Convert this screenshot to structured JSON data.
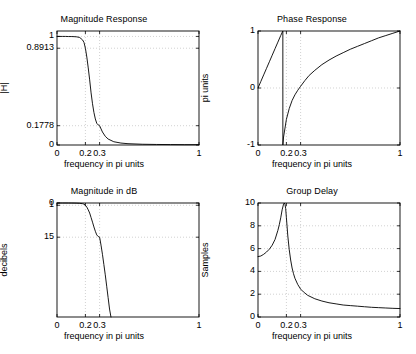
{
  "figure": {
    "background": "#ffffff",
    "line_color": "#000000",
    "grid_color": "#bfbfbf",
    "axis_color": "#000000",
    "width": 416,
    "height": 354
  },
  "chart_data": [
    {
      "type": "line",
      "title": "Magnitude Response",
      "xlabel": "frequency in pi units",
      "ylabel": "|H|",
      "xlim": [
        0,
        1
      ],
      "ylim": [
        0,
        1.05
      ],
      "grid": true,
      "xticks": [
        0,
        0.2,
        0.3,
        1
      ],
      "xticklabels": [
        "0",
        "0.2",
        "0.3",
        "1"
      ],
      "yticks": [
        0,
        0.1778,
        0.8913,
        1
      ],
      "yticklabels": [
        "0",
        "0.1778",
        "0.8913",
        "1"
      ],
      "series": [
        {
          "name": "|H(w)|",
          "x": [
            0,
            0.02,
            0.04,
            0.06,
            0.08,
            0.1,
            0.12,
            0.14,
            0.16,
            0.18,
            0.19,
            0.2,
            0.21,
            0.22,
            0.23,
            0.24,
            0.25,
            0.26,
            0.27,
            0.28,
            0.29,
            0.3,
            0.32,
            0.34,
            0.36,
            0.4,
            0.45,
            0.5,
            0.6,
            0.7,
            0.8,
            0.9,
            1
          ],
          "y": [
            1,
            1,
            1,
            1,
            0.999,
            0.999,
            0.998,
            0.996,
            0.99,
            0.968,
            0.945,
            0.8913,
            0.81,
            0.71,
            0.6,
            0.48,
            0.38,
            0.3,
            0.24,
            0.2,
            0.185,
            0.1778,
            0.12,
            0.08,
            0.055,
            0.03,
            0.018,
            0.012,
            0.007,
            0.005,
            0.004,
            0.003,
            0.003
          ]
        }
      ]
    },
    {
      "type": "line",
      "title": "Phase Response",
      "xlabel": "frequency in pi units",
      "ylabel": "pi units",
      "xlim": [
        0,
        1
      ],
      "ylim": [
        -1,
        1
      ],
      "grid": true,
      "xticks": [
        0,
        0.2,
        0.3,
        1
      ],
      "xticklabels": [
        "0",
        "0.2",
        "0.3",
        "1"
      ],
      "yticks": [
        -1,
        0,
        1
      ],
      "yticklabels": [
        "-1",
        "0",
        "1"
      ],
      "series": [
        {
          "name": "angle(H(w))/pi",
          "x": [
            0,
            0.02,
            0.04,
            0.06,
            0.08,
            0.1,
            0.12,
            0.14,
            0.16,
            0.172,
            0.175,
            0.1751,
            0.18,
            0.2,
            0.22,
            0.24,
            0.26,
            0.28,
            0.3,
            0.33,
            0.36,
            0.4,
            0.45,
            0.5,
            0.55,
            0.6,
            0.65,
            0.7,
            0.75,
            0.8,
            0.85,
            0.9,
            0.95,
            1
          ],
          "y": [
            0,
            0.115,
            0.23,
            0.345,
            0.46,
            0.575,
            0.69,
            0.805,
            0.92,
            0.985,
            1.0,
            -1.0,
            -0.86,
            -0.55,
            -0.36,
            -0.22,
            -0.12,
            -0.04,
            0.03,
            0.13,
            0.22,
            0.31,
            0.41,
            0.49,
            0.56,
            0.62,
            0.68,
            0.73,
            0.78,
            0.83,
            0.88,
            0.92,
            0.96,
            1.0
          ]
        }
      ]
    },
    {
      "type": "line",
      "title": "Magnitude in dB",
      "xlabel": "frequency in pi units",
      "ylabel": "decibels",
      "xlim": [
        0,
        1
      ],
      "ylim": [
        0,
        50
      ],
      "y_inverted": true,
      "grid": true,
      "xticks": [
        0,
        0.2,
        0.3,
        1
      ],
      "xticklabels": [
        "0",
        "0.2",
        "0.3",
        "1"
      ],
      "yticks": [
        0,
        1,
        15
      ],
      "yticklabels": [
        "0",
        "1",
        "15"
      ],
      "series": [
        {
          "name": "-20*log10(|H|)",
          "x": [
            0,
            0.04,
            0.08,
            0.1,
            0.12,
            0.14,
            0.16,
            0.18,
            0.19,
            0.2,
            0.21,
            0.22,
            0.23,
            0.24,
            0.25,
            0.26,
            0.27,
            0.28,
            0.29,
            0.3,
            0.31,
            0.32,
            0.33,
            0.34,
            0.35,
            0.36,
            0.37,
            0.38
          ],
          "y": [
            0,
            0.0,
            0.01,
            0.02,
            0.04,
            0.08,
            0.15,
            0.3,
            0.5,
            1.0,
            1.8,
            3.0,
            4.4,
            6.4,
            8.4,
            10.5,
            12.4,
            14.0,
            14.7,
            15.0,
            18.5,
            22.5,
            27.0,
            31.5,
            36.5,
            41.5,
            46.5,
            50
          ]
        }
      ]
    },
    {
      "type": "line",
      "title": "Group Delay",
      "xlabel": "frequency in pi units",
      "ylabel": "Samples",
      "xlim": [
        0,
        1
      ],
      "ylim": [
        0,
        10
      ],
      "grid": true,
      "xticks": [
        0,
        0.2,
        0.3,
        1
      ],
      "xticklabels": [
        "0",
        "0.2",
        "0.3",
        "1"
      ],
      "yticks": [
        0,
        2,
        4,
        6,
        8,
        10
      ],
      "yticklabels": [
        "0",
        "2",
        "4",
        "6",
        "8",
        "10"
      ],
      "series": [
        {
          "name": "grpdelay",
          "x": [
            0,
            0.02,
            0.04,
            0.06,
            0.08,
            0.1,
            0.12,
            0.14,
            0.15,
            0.16,
            0.17,
            0.18,
            0.185,
            0.19,
            0.195,
            0.2,
            0.205,
            0.21,
            0.22,
            0.23,
            0.24,
            0.25,
            0.26,
            0.28,
            0.3,
            0.32,
            0.35,
            0.4,
            0.45,
            0.5,
            0.55,
            0.6,
            0.65,
            0.7,
            0.75,
            0.8,
            0.85,
            0.9,
            0.95,
            1
          ],
          "y": [
            5.3,
            5.35,
            5.5,
            5.7,
            5.95,
            6.3,
            6.8,
            7.6,
            8.1,
            8.7,
            9.4,
            9.9,
            10.0,
            9.9,
            9.5,
            8.7,
            7.9,
            7.1,
            5.9,
            5.0,
            4.3,
            3.8,
            3.4,
            2.85,
            2.45,
            2.2,
            1.9,
            1.6,
            1.4,
            1.25,
            1.15,
            1.05,
            1.0,
            0.95,
            0.9,
            0.85,
            0.82,
            0.79,
            0.76,
            0.74
          ]
        }
      ]
    }
  ]
}
